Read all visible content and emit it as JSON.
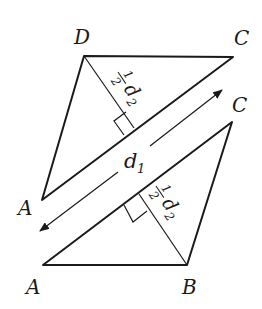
{
  "figure": {
    "type": "rhombus-area-decomposition",
    "top_triangle": {
      "vertices": {
        "D": "D",
        "C": "C",
        "A": "A"
      },
      "height_label": {
        "frac_num": "1",
        "frac_den": "2",
        "var": "d",
        "sub": "2"
      }
    },
    "bottom_triangle": {
      "vertices": {
        "C": "C",
        "A": "A",
        "B": "B"
      },
      "height_label": {
        "frac_num": "1",
        "frac_den": "2",
        "var": "d",
        "sub": "2"
      }
    },
    "diagonal_arrow": {
      "label_var": "d",
      "label_sub": "1",
      "direction": "double-headed"
    },
    "colors": {
      "stroke": "#1a1a1a",
      "background": "#ffffff"
    }
  }
}
